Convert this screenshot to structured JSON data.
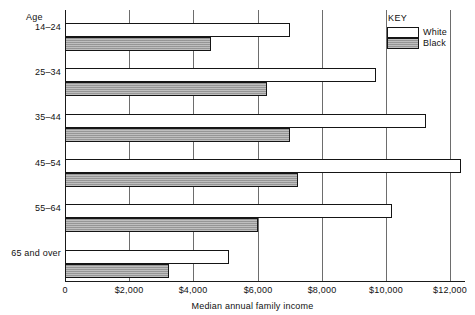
{
  "chart_data": {
    "type": "bar",
    "orientation": "horizontal",
    "title": "",
    "subtitle": "",
    "xlabel": "Median annual family income",
    "ylabel": "Age",
    "xlim": [
      0,
      12800
    ],
    "ylim": null,
    "grid": true,
    "legend_position": "top-right",
    "legend_title": "KEY",
    "categories": [
      "14–24",
      "25–34",
      "35–44",
      "45–54",
      "55–64",
      "65 and over"
    ],
    "series": [
      {
        "name": "White",
        "values": [
          7000,
          9700,
          11250,
          12350,
          10200,
          5100
        ]
      },
      {
        "name": "Black",
        "values": [
          4550,
          6300,
          7000,
          7250,
          6000,
          3250
        ]
      }
    ],
    "xticks": [
      0,
      2000,
      4000,
      6000,
      8000,
      10000,
      12000
    ],
    "xtick_labels": [
      "0",
      "$2,000",
      "$4,000",
      "$6,000",
      "$8,000",
      "$10,000",
      "$12,000"
    ],
    "annotations": []
  },
  "axes": {
    "y_title": "Age",
    "x_title": "Median annual family income"
  },
  "legend": {
    "title": "KEY",
    "entries": [
      {
        "label": "White",
        "swatch": "white-open"
      },
      {
        "label": "Black",
        "swatch": "gray-hatched"
      }
    ]
  },
  "colors": {
    "white_bar_fill": "#ffffff",
    "black_bar_fill": "#9e9e9e",
    "bar_outline": "#151515",
    "gridline": "#6d6d6d",
    "axis": "#1a1a1a",
    "text": "#111111",
    "background": "#ffffff"
  }
}
